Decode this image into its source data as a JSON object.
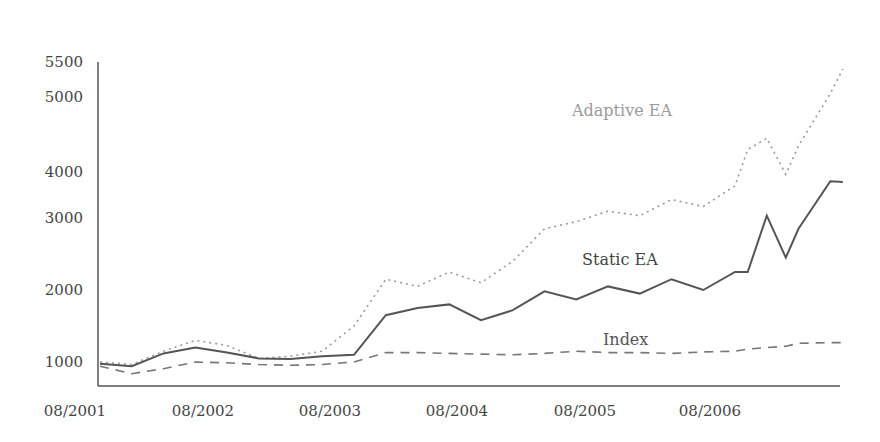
{
  "chart_data": {
    "type": "line",
    "title": "",
    "xlabel": "",
    "ylabel": "",
    "grid": false,
    "legend_position": "inline labels",
    "x_ticks": [
      "08/2001",
      "08/2002",
      "08/2003",
      "08/2004",
      "08/2005",
      "08/2006"
    ],
    "y_ticks": [
      1000,
      2000,
      3000,
      4000,
      5000,
      5500
    ],
    "ylim": [
      880,
      5500
    ],
    "x": [
      0,
      0.25,
      0.5,
      0.75,
      1.0,
      1.25,
      1.5,
      1.75,
      2.0,
      2.25,
      2.5,
      2.75,
      3.0,
      3.25,
      3.5,
      3.75,
      4.0,
      4.25,
      4.5,
      4.75,
      5.0,
      5.1,
      5.25,
      5.4,
      5.5,
      5.75,
      5.85
    ],
    "series": [
      {
        "name": "Adaptive EA",
        "style": "dotted",
        "color": "#9a9a9a",
        "values": [
          1000,
          970,
          1150,
          1300,
          1230,
          1050,
          1080,
          1150,
          1500,
          2150,
          2050,
          2250,
          2100,
          2400,
          2850,
          2950,
          3150,
          3050,
          3400,
          3250,
          3700,
          4300,
          4450,
          3950,
          4350,
          5050,
          5400
        ]
      },
      {
        "name": "Static EA",
        "style": "solid",
        "color": "#555555",
        "values": [
          980,
          950,
          1120,
          1200,
          1130,
          1050,
          1040,
          1080,
          1100,
          1650,
          1750,
          1800,
          1580,
          1720,
          1980,
          1870,
          2050,
          1950,
          2150,
          2000,
          2250,
          2250,
          3050,
          2450,
          2850,
          3800,
          3780
        ]
      },
      {
        "name": "Index",
        "style": "dashed",
        "color": "#777777",
        "values": [
          950,
          860,
          920,
          1000,
          990,
          970,
          960,
          970,
          1000,
          1130,
          1130,
          1120,
          1110,
          1100,
          1120,
          1150,
          1130,
          1130,
          1120,
          1140,
          1150,
          1180,
          1200,
          1220,
          1260,
          1270,
          1270
        ]
      }
    ],
    "annotations": [
      {
        "text": "Adaptive EA",
        "x_pos": 0.79,
        "y_val": 4380
      },
      {
        "text": "Static EA",
        "x_pos": 0.72,
        "y_val": 2000
      },
      {
        "text": "Index",
        "x_pos": 0.72,
        "y_val": 1200
      }
    ]
  }
}
